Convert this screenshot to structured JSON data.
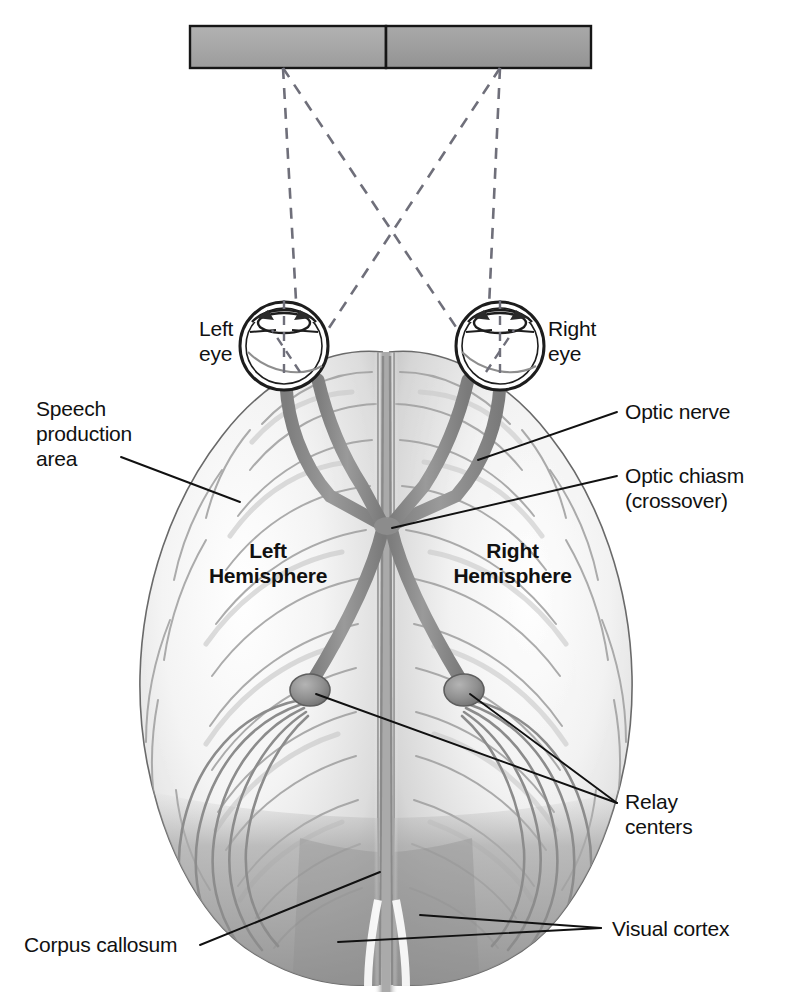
{
  "figure": {
    "kind": "anatomical-diagram"
  },
  "stimulus_bar": {
    "name": "visual-field-bar",
    "left_half_color": "#a8a8a8",
    "right_half_color": "#9d9d9d",
    "border_color": "#1a1a1a"
  },
  "colors": {
    "optic_pathway": "#8c8c8c",
    "brain_light": "#f2f2f2",
    "brain_mid": "#cfcfcf",
    "visual_cortex_shade": "#9a9a9a",
    "leader_line": "#111111",
    "dashed_ray": "#6f6f7a"
  },
  "labels": {
    "left_eye": "Left\neye",
    "right_eye": "Right\neye",
    "speech_production": "Speech\nproduction\narea",
    "optic_nerve": "Optic nerve",
    "optic_chiasm": "Optic chiasm\n(crossover)",
    "left_hemisphere": "Left\nHemisphere",
    "right_hemisphere": "Right\nHemisphere",
    "relay_centers": "Relay\ncenters",
    "corpus_callosum": "Corpus callosum",
    "visual_cortex": "Visual cortex"
  },
  "icons": {
    "eye_left": "eye-icon",
    "eye_right": "eye-icon",
    "relay_center_left": "relay-center-icon",
    "relay_center_right": "relay-center-icon",
    "chiasm": "optic-chiasm-icon"
  }
}
